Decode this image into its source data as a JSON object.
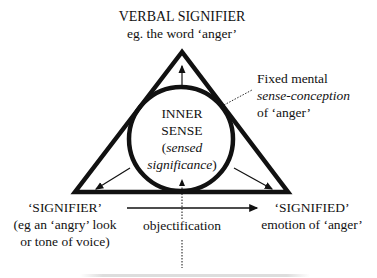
{
  "diagram": {
    "top_label": {
      "title": "VERBAL SIGNIFIER",
      "subtitle": "eg. the word ‘anger’"
    },
    "right_annotation": {
      "line1": "Fixed mental",
      "line2": "sense-conception",
      "line3": "of ‘anger’"
    },
    "center_label": {
      "line1": "INNER",
      "line2": "SENSE",
      "line3_open": "(",
      "line3": "sensed",
      "line4": "significance",
      "line4_close": ")"
    },
    "left_label": {
      "title": "‘SIGNIFIER’",
      "line2": "(eg an ‘angry’ look",
      "line3": "or tone of voice)"
    },
    "right_label": {
      "title": "‘SIGNIFIED’",
      "line2": "emotion of ‘anger’"
    },
    "bottom_label": "objectification",
    "colors": {
      "stroke": "#111111",
      "background": "#ffffff"
    }
  }
}
